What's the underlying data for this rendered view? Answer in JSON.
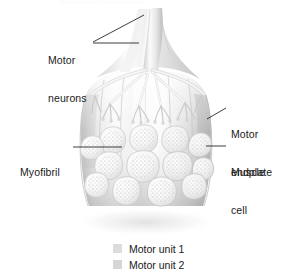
{
  "figure": {
    "title": "Motor units of a skeletal muscle",
    "background_color": "#ffffff",
    "width": 292,
    "height": 275
  },
  "labels": [
    {
      "id": "motor-neurons",
      "text": "Motor\nneurons",
      "line1": "Motor",
      "line2": "neurons",
      "side": "left",
      "x": 48,
      "y": 29
    },
    {
      "id": "myofibril",
      "text": "Myofibril",
      "line1": "Myofibril",
      "line2": "",
      "side": "left",
      "x": 20,
      "y": 141
    },
    {
      "id": "motor-endplate",
      "text": "Motor\nendplate",
      "line1": "Motor",
      "line2": "endplate",
      "side": "right",
      "x": 231,
      "y": 103
    },
    {
      "id": "muscle-cell",
      "text": "Muscle\ncell",
      "line1": "Muscle",
      "line2": "cell",
      "side": "right",
      "x": 231,
      "y": 141
    }
  ],
  "legend": {
    "items": [
      {
        "label": "Motor unit 1",
        "color": "#dcdcdc"
      },
      {
        "label": "Motor unit 2",
        "color": "#d6d6d6"
      }
    ]
  },
  "colors": {
    "text": "#1a1a1a",
    "leader_line": "#1a1a1a",
    "muscle_light": "#f3f3f3",
    "muscle_mid": "#d9d9d9",
    "muscle_shadow": "#a8a8a8",
    "nerve": "#ededed",
    "outline": "#c4c4c4"
  },
  "illustration": {
    "name": "motor-unit-diagram",
    "description": "Cutaway of a skeletal muscle showing two motor neurons branching into axon terminals that form motor endplates on muscle cells; the cut face reveals muscle cells packed with myofibrils."
  }
}
